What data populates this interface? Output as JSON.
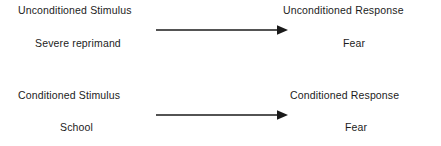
{
  "diagram": {
    "type": "classical-conditioning",
    "background_color": "#ffffff",
    "text_color": "#1c1c1c",
    "arrow_color": "#1a1a1a",
    "rows": [
      {
        "id": "unconditioned",
        "stimulus_heading": "Unconditioned Stimulus",
        "stimulus_example": "Severe reprimand",
        "arrow": "right-arrow",
        "response_heading": "Unconditioned Response",
        "response_example": "Fear"
      },
      {
        "id": "conditioned",
        "stimulus_heading": "Conditioned Stimulus",
        "stimulus_example": "School",
        "arrow": "right-arrow",
        "response_heading": "Conditioned Response",
        "response_example": "Fear"
      }
    ]
  }
}
